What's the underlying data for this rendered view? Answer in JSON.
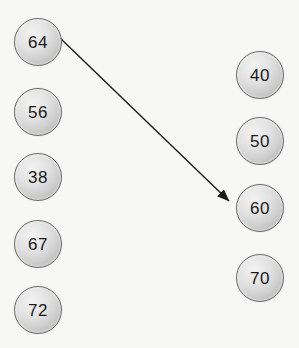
{
  "canvas": {
    "width": 299,
    "height": 348,
    "background_color": "#f7f7f5"
  },
  "style": {
    "node_fill_light": "#f2f2f2",
    "node_fill_dark": "#a6a6a6",
    "node_border_color": "#6e6e6e",
    "node_text_color": "#1a1a1a",
    "edge_color": "#1a1a1a",
    "node_diameter": 48
  },
  "left_column": {
    "name": "left-node-column",
    "nodes": [
      {
        "id": "left-node-64",
        "label": "64",
        "x": 14,
        "y": 18
      },
      {
        "id": "left-node-56",
        "label": "56",
        "x": 14,
        "y": 88
      },
      {
        "id": "left-node-38",
        "label": "38",
        "x": 14,
        "y": 153
      },
      {
        "id": "left-node-67",
        "label": "67",
        "x": 14,
        "y": 220
      },
      {
        "id": "left-node-72",
        "label": "72",
        "x": 14,
        "y": 286
      }
    ]
  },
  "right_column": {
    "name": "right-node-column",
    "nodes": [
      {
        "id": "right-node-40",
        "label": "40",
        "x": 236,
        "y": 51
      },
      {
        "id": "right-node-50",
        "label": "50",
        "x": 236,
        "y": 117
      },
      {
        "id": "right-node-60",
        "label": "60",
        "x": 236,
        "y": 184
      },
      {
        "id": "right-node-70",
        "label": "70",
        "x": 236,
        "y": 254
      }
    ]
  },
  "edges": [
    {
      "id": "edge-64-to-60",
      "from": "64",
      "to": "60",
      "x1": 60,
      "y1": 38,
      "x2": 233,
      "y2": 204,
      "arrowhead": "end"
    }
  ]
}
